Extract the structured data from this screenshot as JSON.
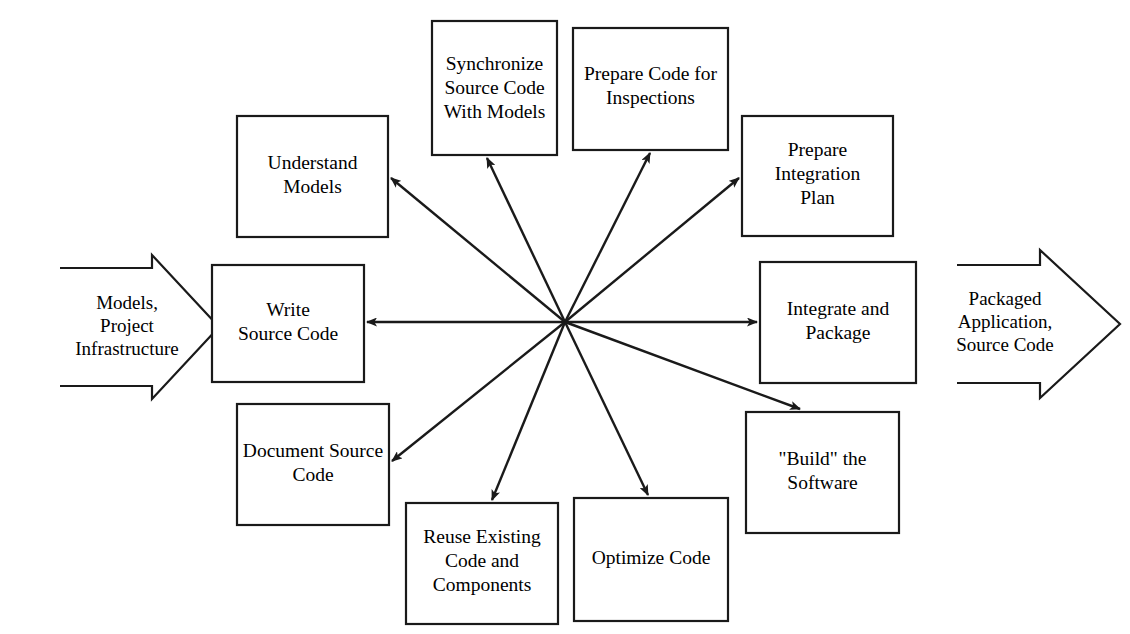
{
  "diagram": {
    "type": "hub-and-spoke-process-diagram",
    "background_color": "#ffffff",
    "line_color": "#1a1a1a",
    "text_color": "#000000",
    "hub": {
      "x": 565,
      "y": 322
    },
    "inputs": [
      {
        "id": "input-left",
        "lines": [
          "Models,",
          "Project",
          "Infrastructure"
        ],
        "direction": "right",
        "x": 60,
        "y": 255,
        "width": 160,
        "height": 145
      }
    ],
    "outputs": [
      {
        "id": "output-right",
        "lines": [
          "Packaged",
          "Application,",
          "Source Code"
        ],
        "direction": "right",
        "x": 955,
        "y": 250,
        "width": 165,
        "height": 148
      }
    ],
    "boxes": [
      {
        "id": "understand-models",
        "lines": [
          "Understand",
          "Models"
        ],
        "x": 237,
        "y": 116,
        "width": 151,
        "height": 121
      },
      {
        "id": "synchronize-source-code-with-models",
        "lines": [
          "Synchronize",
          "Source Code",
          "With Models"
        ],
        "x": 432,
        "y": 21,
        "width": 125,
        "height": 134
      },
      {
        "id": "prepare-code-for-inspections",
        "lines": [
          "Prepare Code for",
          "Inspections"
        ],
        "x": 573,
        "y": 28,
        "width": 155,
        "height": 122
      },
      {
        "id": "prepare-integration-plan",
        "lines": [
          "Prepare",
          "Integration",
          "Plan"
        ],
        "x": 742,
        "y": 116,
        "width": 151,
        "height": 120
      },
      {
        "id": "write-source-code",
        "lines": [
          "Write",
          "Source Code"
        ],
        "x": 212,
        "y": 265,
        "width": 152,
        "height": 117
      },
      {
        "id": "integrate-and-package",
        "lines": [
          "Integrate and",
          "Package"
        ],
        "x": 760,
        "y": 262,
        "width": 156,
        "height": 121
      },
      {
        "id": "document-source-code",
        "lines": [
          "Document Source",
          "Code"
        ],
        "x": 237,
        "y": 404,
        "width": 152,
        "height": 121
      },
      {
        "id": "build-the-software",
        "lines": [
          "\"Build\" the",
          "Software"
        ],
        "x": 746,
        "y": 412,
        "width": 153,
        "height": 121
      },
      {
        "id": "reuse-existing-code-and-components",
        "lines": [
          "Reuse Existing",
          "Code and",
          "Components"
        ],
        "x": 406,
        "y": 503,
        "width": 152,
        "height": 121
      },
      {
        "id": "optimize-code",
        "lines": [
          "Optimize Code"
        ],
        "x": 574,
        "y": 498,
        "width": 154,
        "height": 123
      }
    ],
    "connections": [
      {
        "id": "hub-to-understand-models",
        "target": "understand-models",
        "from": [
          565,
          322
        ],
        "to": [
          391,
          178
        ]
      },
      {
        "id": "hub-to-synchronize",
        "target": "synchronize-source-code-with-models",
        "from": [
          565,
          322
        ],
        "to": [
          487,
          158
        ]
      },
      {
        "id": "hub-to-prepare-code-inspections",
        "target": "prepare-code-for-inspections",
        "from": [
          565,
          322
        ],
        "to": [
          650,
          153
        ]
      },
      {
        "id": "hub-to-prepare-integration-plan",
        "target": "prepare-integration-plan",
        "from": [
          565,
          322
        ],
        "to": [
          739,
          178
        ]
      },
      {
        "id": "hub-to-write-source-code",
        "target": "write-source-code",
        "from": [
          565,
          322
        ],
        "to": [
          367,
          322
        ]
      },
      {
        "id": "hub-to-integrate-and-package",
        "target": "integrate-and-package",
        "from": [
          565,
          322
        ],
        "to": [
          757,
          322
        ]
      },
      {
        "id": "hub-to-document-source-code",
        "target": "document-source-code",
        "from": [
          565,
          322
        ],
        "to": [
          392,
          461
        ]
      },
      {
        "id": "hub-to-build-the-software",
        "target": "build-the-software",
        "from": [
          565,
          322
        ],
        "to": [
          800,
          409
        ]
      },
      {
        "id": "hub-to-reuse-existing-code",
        "target": "reuse-existing-code-and-components",
        "from": [
          565,
          322
        ],
        "to": [
          492,
          500
        ]
      },
      {
        "id": "hub-to-optimize-code",
        "target": "optimize-code",
        "from": [
          565,
          322
        ],
        "to": [
          648,
          495
        ]
      }
    ]
  }
}
